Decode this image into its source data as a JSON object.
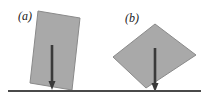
{
  "figure": {
    "type": "physics-diagram",
    "background_color": "#ffffff",
    "ground": {
      "label": "ground-line",
      "color": "#4a4a4a",
      "x_start": 8,
      "x_end": 201,
      "y": 91,
      "thickness": 2.2
    },
    "panels": [
      {
        "id": "a",
        "label": "(a)",
        "label_x": 18,
        "label_y": 20,
        "block": {
          "name": "tilted-block-a",
          "fill": "#a9a9a9",
          "edge_color": "#8a8a8a",
          "tilt_degrees": 10,
          "corners": [
            [
              38,
              11
            ],
            [
              80,
              18
            ],
            [
              72,
              90
            ],
            [
              30,
              83
            ]
          ]
        },
        "arrow": {
          "name": "weight-arrow-a",
          "color": "#3a3a3a",
          "x": 52,
          "y_start": 45,
          "y_end": 90,
          "shaft_width": 2.6,
          "head_width": 7,
          "head_length": 9
        }
      },
      {
        "id": "b",
        "label": "(b)",
        "label_x": 125,
        "label_y": 22,
        "block": {
          "name": "tilted-block-b",
          "fill": "#a9a9a9",
          "edge_color": "#8a8a8a",
          "tilt_degrees": 40,
          "corners": [
            [
              155,
              24
            ],
            [
              196,
              55
            ],
            [
              146,
              88
            ],
            [
              113,
              57
            ]
          ]
        },
        "arrow": {
          "name": "weight-arrow-b",
          "color": "#3a3a3a",
          "x": 155,
          "y_start": 48,
          "y_end": 92,
          "shaft_width": 2.6,
          "head_width": 7,
          "head_length": 9
        }
      }
    ]
  }
}
